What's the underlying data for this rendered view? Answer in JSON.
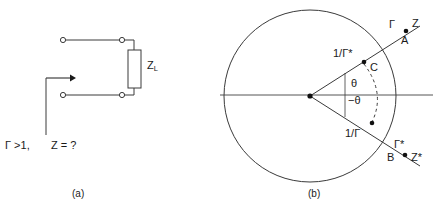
{
  "figure": {
    "panels": [
      {
        "id": "a",
        "caption": "(a)",
        "description": "Source looking into a load impedance Z_L"
      },
      {
        "id": "b",
        "caption": "(b)",
        "description": "Unit circle in the reflection-coefficient plane"
      }
    ]
  },
  "panel_a": {
    "caption": "(a)",
    "load_label": {
      "base": "Z",
      "subscript": "L"
    },
    "annotation": {
      "gamma_condition": "Γ >1,",
      "unknown": "Z = ?"
    },
    "terminals": [
      {
        "name": "top-left-terminal",
        "x": 62,
        "y": 40
      },
      {
        "name": "top-right-terminal",
        "x": 122,
        "y": 40
      },
      {
        "name": "bottom-left-terminal",
        "x": 62,
        "y": 95
      },
      {
        "name": "bottom-right-terminal",
        "x": 122,
        "y": 95
      }
    ],
    "resistor_box": {
      "x": 128,
      "y": 50,
      "width": 13,
      "height": 38
    },
    "arrow": {
      "from_x": 46,
      "from_y": 78,
      "to_x": 74,
      "to_y": 78
    },
    "leader_line": {
      "x": 46,
      "y_top": 78,
      "y_bottom": 135
    }
  },
  "panel_b": {
    "caption": "(b)",
    "circle": {
      "cx": 310,
      "cy": 96,
      "r": 86
    },
    "origin": {
      "cx": 310,
      "cy": 96
    },
    "axis": {
      "x1": 220,
      "x2": 433,
      "y": 95
    },
    "angle_labels": {
      "positive": "θ",
      "negative": "−θ"
    },
    "points": [
      {
        "name": "point-C",
        "letter": "C",
        "value": "1/Γ*",
        "x": 364,
        "y": 62
      },
      {
        "name": "point-lower-inverse",
        "letter": "",
        "value": "1/Γ",
        "x": 372,
        "y": 123
      },
      {
        "name": "point-A",
        "letter": "A",
        "value_gamma": "Γ",
        "value_z": "Z",
        "x": 406,
        "y": 31
      },
      {
        "name": "point-B",
        "letter": "B",
        "value_gamma": "Γ*",
        "value_z": "Z*",
        "x": 405,
        "y": 155
      }
    ],
    "rays": [
      {
        "name": "upper-ray",
        "x1": 310,
        "y1": 96,
        "x2": 420,
        "y2": 26
      },
      {
        "name": "lower-ray",
        "x1": 310,
        "y1": 96,
        "x2": 420,
        "y2": 166
      }
    ],
    "dashed_arc": {
      "name": "constant-magnitude-arc",
      "from_x": 364,
      "from_y": 64,
      "to_x": 372,
      "to_y": 122
    },
    "angle_ticks": [
      {
        "name": "upper-angle-tick",
        "x": 345,
        "y1": 78,
        "y2": 95
      },
      {
        "name": "lower-angle-tick",
        "x": 345,
        "y1": 95,
        "y2": 112
      }
    ]
  },
  "colors": {
    "stroke": "#3a3a3a",
    "axis": "#555555",
    "text": "#1a1a1a",
    "background": "#ffffff"
  }
}
